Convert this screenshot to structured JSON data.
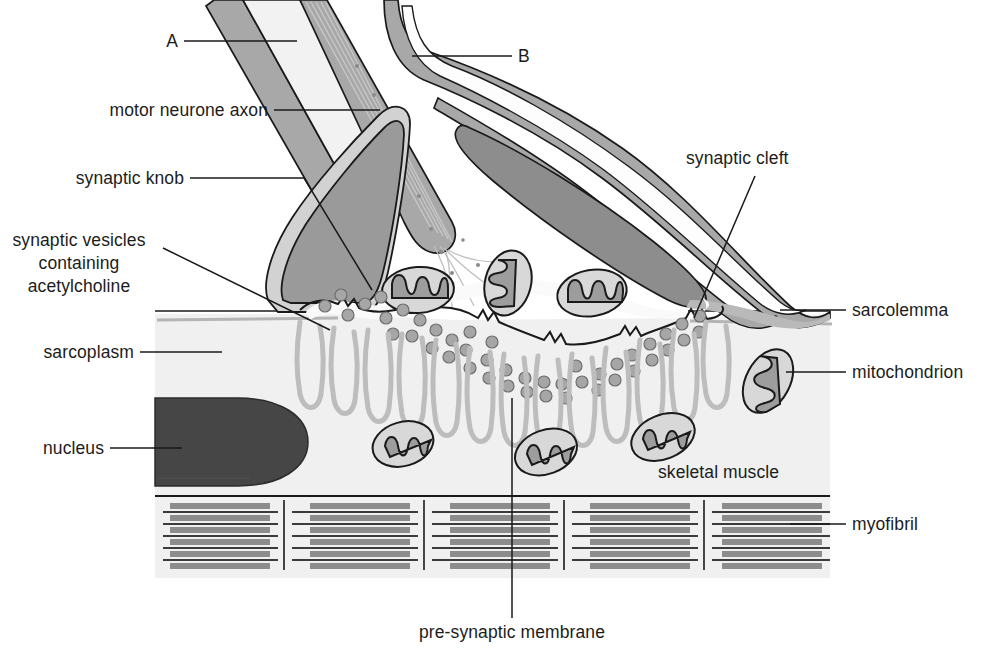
{
  "diagram": {
    "type": "biological-structure-diagram"
  },
  "labels": {
    "a": "A",
    "b": "B",
    "motor_neurone_axon": "motor neurone axon",
    "synaptic_knob": "synaptic knob",
    "synaptic_vesicles_line1": "synaptic vesicles",
    "synaptic_vesicles_line2": "containing",
    "synaptic_vesicles_line3": "acetylcholine",
    "sarcoplasm": "sarcoplasm",
    "nucleus": "nucleus",
    "synaptic_cleft": "synaptic cleft",
    "sarcolemma": "sarcolemma",
    "mitochondrion": "mitochondrion",
    "skeletal_muscle": "skeletal muscle",
    "myofibril": "myofibril",
    "pre_synaptic_membrane": "pre-synaptic membrane"
  },
  "colors": {
    "background": "#ffffff",
    "outline": "#1a1a1a",
    "sheath_fill": "#a8a8a8",
    "axoplasm_fill": "#f2f2f2",
    "knob_fill": "#9a9a9a",
    "schwann_nucleus_fill": "#8d8d8d",
    "muscle_nucleus_fill": "#464646",
    "sarcoplasm_fill": "#f0f0f0",
    "mito_body_fill": "#d8d8d8",
    "mito_crista_fill": "#9d9d9d",
    "vesicle_fill": "#a6a6a6",
    "post_fold_stroke": "#bdbdbd",
    "sarcolemma_stroke": "#b5b5b5",
    "myofibril_thick": "#8c8c8c",
    "myofibril_thin": "#3b3b3b",
    "label_text": "#1c1c1c",
    "leader_line": "#1a1a1a"
  },
  "structures": {
    "myelinated_axon": "diagonal myelinated motor neurone axon entering from top-left",
    "schwann_cell": "Schwann cell with elongated nucleus over the synaptic knob",
    "synaptic_knob_count": 1,
    "mitochondria_in_knob": 3,
    "mitochondria_in_muscle": 4,
    "synaptic_vesicle_count": 44,
    "myofibril_blocks": 5,
    "myofibril_bands_per_block": 6
  }
}
